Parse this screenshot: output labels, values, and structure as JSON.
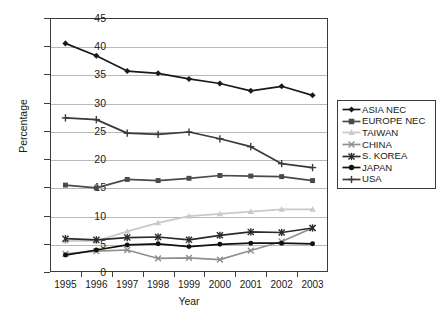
{
  "chart_data": {
    "type": "line",
    "title": "",
    "xlabel": "Year",
    "ylabel": "Percentage",
    "categories": [
      "1995",
      "1996",
      "1997",
      "1998",
      "1999",
      "2000",
      "2001",
      "2002",
      "2003"
    ],
    "x": [
      1995,
      1996,
      1997,
      1998,
      1999,
      2000,
      2001,
      2002,
      2003
    ],
    "ylim": [
      0,
      45
    ],
    "yticks": [
      0,
      5,
      10,
      15,
      20,
      25,
      30,
      35,
      40,
      45
    ],
    "grid": true,
    "legend_position": "right",
    "series": [
      {
        "name": "ASIA NEC",
        "marker": "diamond",
        "color": "#1a1a1a",
        "values": [
          40.5,
          38.3,
          35.6,
          35.2,
          34.2,
          33.4,
          32.1,
          32.9,
          31.3
        ]
      },
      {
        "name": "EUROPE NEC",
        "marker": "square",
        "color": "#4a4a4a",
        "values": [
          15.4,
          14.9,
          16.4,
          16.2,
          16.6,
          17.1,
          17.0,
          16.9,
          16.2
        ]
      },
      {
        "name": "TAIWAN",
        "marker": "triangle",
        "color": "#c9c9c9",
        "values": [
          5.5,
          5.5,
          7.2,
          8.7,
          9.9,
          10.3,
          10.7,
          11.1,
          11.1
        ]
      },
      {
        "name": "CHINA",
        "marker": "cross",
        "color": "#8f8f8f",
        "values": [
          3.2,
          3.7,
          3.9,
          2.4,
          2.5,
          2.2,
          3.8,
          5.4,
          7.8
        ]
      },
      {
        "name": "S. KOREA",
        "marker": "star",
        "color": "#2b2b2b",
        "values": [
          5.9,
          5.7,
          6.1,
          6.2,
          5.7,
          6.5,
          7.1,
          7.0,
          7.8
        ]
      },
      {
        "name": "JAPAN",
        "marker": "circle",
        "color": "#111111",
        "values": [
          3.0,
          3.9,
          4.8,
          5.0,
          4.5,
          4.9,
          5.1,
          5.1,
          5.0
        ]
      },
      {
        "name": "USA",
        "marker": "plus",
        "color": "#3a3a3a",
        "values": [
          27.3,
          27.0,
          24.6,
          24.4,
          24.8,
          23.6,
          22.2,
          19.2,
          18.5
        ]
      }
    ]
  },
  "axes": {
    "y_tick_labels": [
      "45",
      "40",
      "35",
      "30",
      "25",
      "20",
      "15",
      "10",
      "5",
      "0"
    ],
    "x_tick_labels": [
      "1995",
      "1996",
      "1997",
      "1998",
      "1999",
      "2000",
      "2001",
      "2002",
      "2003"
    ],
    "x_title": "Year",
    "y_title": "Percentage"
  },
  "legend": {
    "items": [
      {
        "label": "ASIA NEC"
      },
      {
        "label": "EUROPE NEC"
      },
      {
        "label": "TAIWAN"
      },
      {
        "label": "CHINA"
      },
      {
        "label": "S. KOREA"
      },
      {
        "label": "JAPAN"
      },
      {
        "label": "USA"
      }
    ]
  }
}
